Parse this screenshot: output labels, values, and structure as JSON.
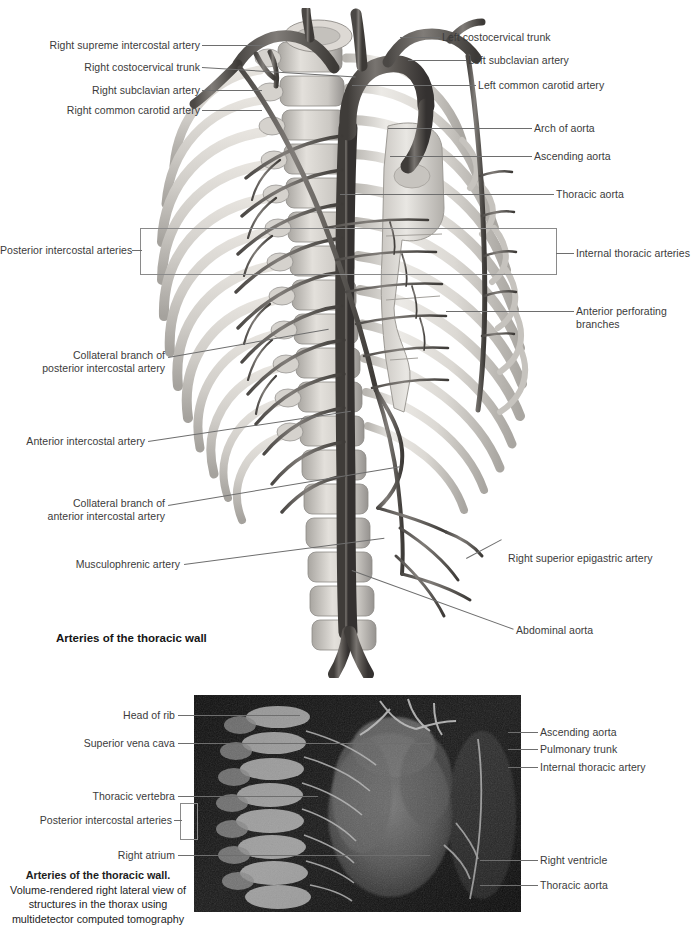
{
  "page": {
    "background": "#ffffff",
    "text_color": "#3b3b3b",
    "leader_color": "#6e6e6e"
  },
  "figure_top": {
    "title": "Arteries of the thoracic wall",
    "labels_left": [
      {
        "text": "Right supreme intercostal artery",
        "x": 60,
        "y": 39,
        "line_to_x": 264,
        "line_to_y": 48
      },
      {
        "text": "Right costocervical trunk",
        "x": 60,
        "y": 61,
        "line_to_x": 300,
        "line_to_y": 78
      },
      {
        "text": "Right subclavian artery",
        "x": 60,
        "y": 84,
        "line_to_x": 262,
        "line_to_y": 90
      },
      {
        "text": "Right common carotid artery",
        "x": 30,
        "y": 104,
        "line_to_x": 262,
        "line_to_y": 107
      },
      {
        "text": "Posterior intercostal arteries",
        "x": 10,
        "y": 244,
        "line_to_x": 140,
        "line_to_y": 250
      },
      {
        "text": "Collateral branch of\nposterior intercostal artery",
        "x": 78,
        "y": 349,
        "line_to_x": 330,
        "line_to_y": 328
      },
      {
        "text": "Anterior intercostal artery",
        "x": 27,
        "y": 435,
        "line_to_x": 348,
        "line_to_y": 411
      },
      {
        "text": "Collateral branch of\nanterior intercostal artery",
        "x": 73,
        "y": 497,
        "line_to_x": 400,
        "line_to_y": 467
      },
      {
        "text": "Musculophrenic artery",
        "x": 74,
        "y": 558,
        "line_to_x": 380,
        "line_to_y": 536
      }
    ],
    "labels_right": [
      {
        "text": "Left costocervical trunk",
        "x": 442,
        "y": 31,
        "line_to_x": 403,
        "line_to_y": 42
      },
      {
        "text": "Left subclavian artery",
        "x": 468,
        "y": 54,
        "line_to_x": 409,
        "line_to_y": 62
      },
      {
        "text": "Left common carotid artery",
        "x": 478,
        "y": 79,
        "line_to_x": 352,
        "line_to_y": 93
      },
      {
        "text": "Arch of aorta",
        "x": 534,
        "y": 122,
        "line_to_x": 388,
        "line_to_y": 128
      },
      {
        "text": "Ascending aorta",
        "x": 534,
        "y": 150,
        "line_to_x": 390,
        "line_to_y": 155
      },
      {
        "text": "Thoracic aorta",
        "x": 556,
        "y": 188,
        "line_to_x": 340,
        "line_to_y": 193
      },
      {
        "text": "Internal thoracic arteries",
        "x": 576,
        "y": 247,
        "line_to_x": 556,
        "line_to_y": 251
      },
      {
        "text": "Anterior perforating\nbranches",
        "x": 576,
        "y": 305,
        "line_to_x": 448,
        "line_to_y": 318
      },
      {
        "text": "Right superior epigastric artery",
        "x": 508,
        "y": 552,
        "line_to_x": 468,
        "line_to_y": 538
      },
      {
        "text": "Abdominal aorta",
        "x": 516,
        "y": 624,
        "line_to_x": 350,
        "line_to_y": 570
      }
    ],
    "bracket": {
      "x": 140,
      "y": 228,
      "width": 415,
      "height": 45
    }
  },
  "figure_bottom": {
    "caption_bold": "Arteries of the thoracic wall.",
    "caption_body": "Volume-rendered right lateral view\nof structures in the thorax using\nmultidetector computed tomography",
    "ct_image": {
      "x": 194,
      "y": 695,
      "width": 327,
      "height": 217,
      "background": "#060606"
    },
    "labels_left": [
      {
        "text": "Head of rib",
        "x": 113,
        "y": 709,
        "line_to_x": 300,
        "line_to_y": 714
      },
      {
        "text": "Superior vena cava",
        "x": 80,
        "y": 737,
        "line_to_x": 430,
        "line_to_y": 742
      },
      {
        "text": "Thoracic vertebra",
        "x": 89,
        "y": 790,
        "line_to_x": 318,
        "line_to_y": 794
      },
      {
        "text": "Posterior intercostal arteries",
        "x": 44,
        "y": 814,
        "line_to_x": 180,
        "line_to_y": 820
      },
      {
        "text": "Right atrium",
        "x": 111,
        "y": 849,
        "line_to_x": 430,
        "line_to_y": 852
      }
    ],
    "labels_right": [
      {
        "text": "Ascending aorta",
        "x": 540,
        "y": 726,
        "line_to_x": 510,
        "line_to_y": 730
      },
      {
        "text": "Pulmonary trunk",
        "x": 540,
        "y": 743,
        "line_to_x": 508,
        "line_to_y": 747
      },
      {
        "text": "Internal thoracic artery",
        "x": 540,
        "y": 761,
        "line_to_x": 511,
        "line_to_y": 765
      },
      {
        "text": "Right ventricle",
        "x": 540,
        "y": 854,
        "line_to_x": 482,
        "line_to_y": 858
      },
      {
        "text": "Thoracic aorta",
        "x": 540,
        "y": 879,
        "line_to_x": 481,
        "line_to_y": 883
      }
    ],
    "bracket": {
      "x": 180,
      "y": 803,
      "width": 16,
      "height": 35
    }
  }
}
